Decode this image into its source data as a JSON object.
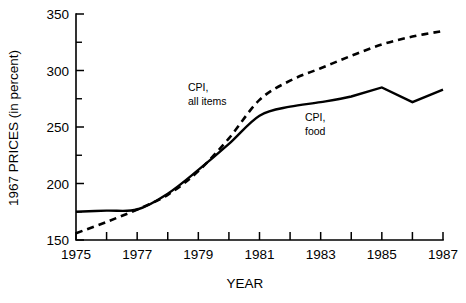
{
  "chart_data": {
    "type": "line",
    "title": "",
    "xlabel": "YEAR",
    "ylabel": "1967 PRICES (in percent)",
    "xlim": [
      1975,
      1987
    ],
    "ylim": [
      150,
      350
    ],
    "grid": false,
    "legend_position": "inline-annotations",
    "x": [
      1975,
      1976,
      1977,
      1978,
      1979,
      1980,
      1981,
      1982,
      1983,
      1984,
      1985,
      1986,
      1987
    ],
    "y_ticks_major": [
      150,
      200,
      250,
      300,
      350
    ],
    "y_ticks_minor": [
      175,
      225,
      275,
      325
    ],
    "x_ticks": [
      1975,
      1976,
      1977,
      1978,
      1979,
      1980,
      1981,
      1982,
      1983,
      1984,
      1985,
      1986,
      1987
    ],
    "x_tick_labels": [
      "1975",
      "",
      "1977",
      "",
      "1979",
      "",
      "1981",
      "",
      "1983",
      "",
      "1985",
      "",
      "1987"
    ],
    "y_tick_labels": [
      "150",
      "200",
      "250",
      "300",
      "350"
    ],
    "series": [
      {
        "name": "CPI, all items",
        "style": "dashed",
        "values": [
          156,
          166,
          177,
          190,
          211,
          240,
          274,
          291,
          302,
          313,
          323,
          330,
          335
        ]
      },
      {
        "name": "CPI, food",
        "style": "solid",
        "values": [
          175,
          176,
          177,
          191,
          212,
          235,
          260,
          268,
          272,
          277,
          285,
          272,
          283
        ]
      }
    ],
    "annotations": [
      {
        "id": "cpi-all-items",
        "lines": [
          "CPI,",
          "all items"
        ],
        "x_px": 188,
        "y_px": 91
      },
      {
        "id": "cpi-food",
        "lines": [
          "CPI,",
          "food"
        ],
        "x_px": 305,
        "y_px": 121
      }
    ]
  },
  "axis": {
    "y_title": "1967 PRICES (in percent)",
    "x_title": "YEAR"
  },
  "colors": {
    "ink": "#000000",
    "background": "#ffffff"
  }
}
